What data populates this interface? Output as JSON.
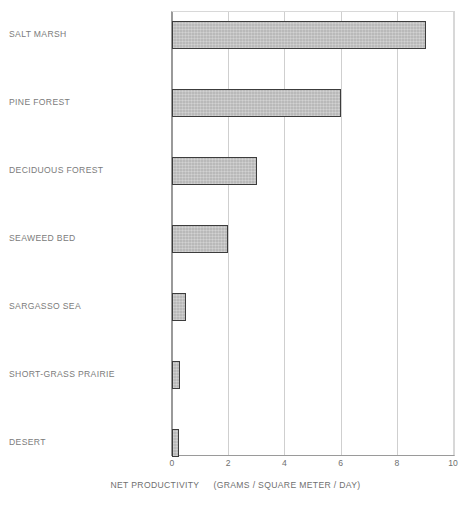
{
  "chart_data": {
    "type": "bar",
    "orientation": "horizontal",
    "title": "",
    "categories": [
      "SALT MARSH",
      "PINE FOREST",
      "DECIDUOUS FOREST",
      "SEAWEED BED",
      "SARGASSO SEA",
      "SHORT-GRASS PRAIRIE",
      "DESERT"
    ],
    "values": [
      9.0,
      6.0,
      3.0,
      2.0,
      0.5,
      0.3,
      0.25
    ],
    "xlabel": "NET PRODUCTIVITY   (GRAMS / SQUARE METER / DAY)",
    "ylabel": "",
    "xlim": [
      0,
      10
    ],
    "xticks": [
      "0",
      "2",
      "4",
      "6",
      "8",
      "10"
    ],
    "grid": "vertical",
    "legend": "none",
    "bar_fill_color": "#b9b9b9",
    "bar_border_color": "#3c3c3c",
    "text_color": "#7b7b7b",
    "grid_color": "#cfcfcf"
  },
  "axis": {
    "title_part1": "NET PRODUCTIVITY",
    "title_part2": "(GRAMS / SQUARE METER / DAY)"
  }
}
